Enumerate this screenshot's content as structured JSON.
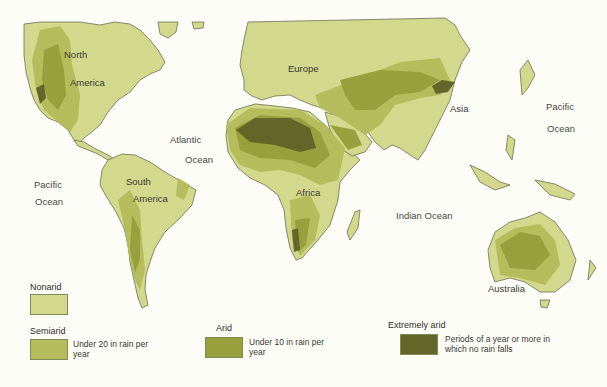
{
  "map": {
    "title": "World arid lands",
    "colors": {
      "background": "#fdfdf8",
      "nonarid": "#d2d88c",
      "semiarid": "#b4bc5c",
      "arid": "#98a03e",
      "extremely_arid": "#626628",
      "coastline": "#6b7050"
    },
    "labels": {
      "north": "North",
      "america_n": "America",
      "south": "South",
      "america_s": "America",
      "europe": "Europe",
      "asia": "Asia",
      "africa": "Africa",
      "australia": "Australia",
      "atlantic": "Atlantic",
      "atlantic_ocean": "Ocean",
      "pacific_w": "Pacific",
      "pacific_w_ocean": "Ocean",
      "pacific_e": "Pacific",
      "pacific_e_ocean": "Ocean",
      "indian_ocean": "Indian Ocean"
    }
  },
  "legend": {
    "items": [
      {
        "title": "Nonarid",
        "description": ""
      },
      {
        "title": "Semiarid",
        "description": "Under 20 in  rain per year"
      },
      {
        "title": "Arid",
        "description": "Under 10 in  rain per year"
      },
      {
        "title": "Extremely arid",
        "description": "Periods of a year or more in which no rain falls"
      }
    ]
  }
}
